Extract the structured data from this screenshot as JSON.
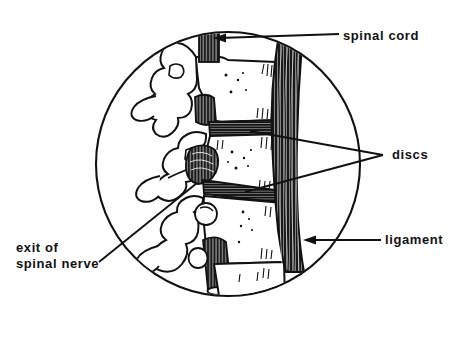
{
  "figure": {
    "kind": "anatomical-illustration",
    "background_color": "#ffffff",
    "ink_color": "#111111",
    "circle": {
      "cx": 228,
      "cy": 164,
      "r": 132
    }
  },
  "labels": {
    "spinal_cord": "spinal cord",
    "discs": "discs",
    "ligament": "ligament",
    "exit_of_spinal_nerve_line1": "exit of",
    "exit_of_spinal_nerve_line2": "spinal nerve"
  },
  "leaders": [
    {
      "name": "spinal-cord-leader",
      "label": "spinal cord",
      "arrow": true,
      "from": [
        339,
        34
      ],
      "to": [
        216,
        38
      ]
    },
    {
      "name": "discs-leader-upper",
      "label": "discs",
      "arrow": false,
      "from": [
        383,
        155
      ],
      "to": [
        248,
        131
      ]
    },
    {
      "name": "discs-leader-lower",
      "label": "discs",
      "arrow": false,
      "from": [
        383,
        155
      ],
      "to": [
        243,
        192
      ]
    },
    {
      "name": "ligament-leader",
      "label": "ligament",
      "arrow": true,
      "from": [
        381,
        240
      ],
      "to": [
        305,
        240
      ]
    },
    {
      "name": "spinal-nerve-leader",
      "label": "exit of spinal nerve",
      "arrow": false,
      "from": [
        99,
        262
      ],
      "to": [
        196,
        183
      ]
    }
  ],
  "anatomy": {
    "spinal_cord": {
      "x": 199,
      "y": 20,
      "w": 20,
      "h": 42,
      "shading": "vertical-striations"
    },
    "ligament": {
      "span_y": [
        40,
        272
      ],
      "x": 276,
      "w": 24,
      "shading": "vertical-striations"
    },
    "vertebral_bodies": 4,
    "discs_count": 2,
    "nerve_roots": 2
  }
}
